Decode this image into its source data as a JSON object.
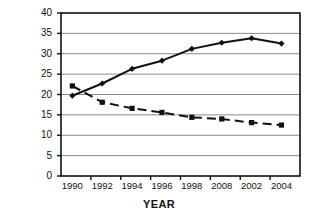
{
  "chart_data": {
    "type": "line",
    "title": "",
    "xlabel": "YEAR",
    "ylabel": "PREVALENCE (%)",
    "categories": [
      "1990",
      "1992",
      "1994",
      "1996",
      "1998",
      "2008",
      "2002",
      "2004"
    ],
    "ylim": [
      0,
      40
    ],
    "ytick_values": [
      0,
      5,
      10,
      15,
      20,
      25,
      30,
      35,
      40
    ],
    "ytick_labels": [
      "0",
      "5",
      "10",
      "15",
      "20",
      "25",
      "30",
      "35",
      "40"
    ],
    "grid": "horizontal",
    "legend": "none",
    "series": [
      {
        "name": "rising-series",
        "style": "solid",
        "marker": "diamond",
        "color": "#111111",
        "values": [
          19.7,
          22.7,
          26.3,
          28.3,
          31.2,
          32.7,
          33.8,
          32.5
        ]
      },
      {
        "name": "falling-series",
        "style": "dashed",
        "marker": "square",
        "color": "#111111",
        "values": [
          22.1,
          18.1,
          16.6,
          15.6,
          14.4,
          14.0,
          13.1,
          12.5
        ]
      }
    ]
  },
  "axes": {
    "plot_left": 61,
    "plot_right": 300,
    "plot_top": 13,
    "plot_bottom": 176,
    "frame_color": "#111111",
    "grid_color": "#8a8a8a"
  }
}
